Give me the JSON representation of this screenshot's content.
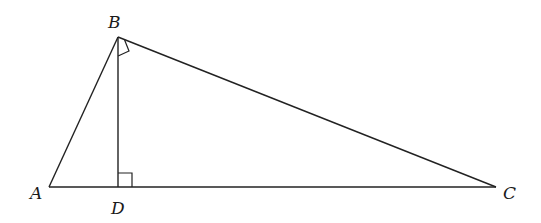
{
  "diagram": {
    "type": "geometry",
    "points": {
      "A": {
        "label": "A"
      },
      "B": {
        "label": "B"
      },
      "C": {
        "label": "C"
      },
      "D": {
        "label": "D"
      }
    },
    "segments": [
      "AB",
      "BC",
      "AC",
      "BD"
    ],
    "right_angles": [
      "ABC",
      "BDC"
    ]
  }
}
